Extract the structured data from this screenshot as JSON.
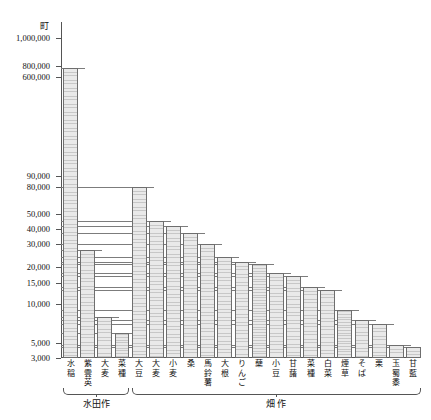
{
  "chart_data": {
    "type": "bar",
    "title": "",
    "subtitle": "",
    "unit_label": "町",
    "xlabel": "",
    "ylabel": "",
    "scale": "log",
    "ylim": [
      3000,
      1000000
    ],
    "grid": true,
    "legend_position": "none",
    "ytick_labels": [
      "1,000,000",
      "800,000",
      "600,000",
      "90,000",
      "80,000",
      "50,000",
      "40,000",
      "30,000",
      "20,000",
      "15,000",
      "10,000",
      "5,000",
      "3,000"
    ],
    "ytick_values": [
      1000000,
      800000,
      600000,
      90000,
      80000,
      50000,
      40000,
      30000,
      20000,
      15000,
      10000,
      5000,
      3000
    ],
    "categories": [
      "水稲",
      "紫雲英",
      "大麦",
      "菜種",
      "大豆",
      "大麦",
      "小麦",
      "桑",
      "馬鈴薯",
      "大根",
      "りんご",
      "蘖",
      "小豆",
      "甘藷",
      "菜種",
      "白菜",
      "煙草",
      "そば",
      "栗",
      "玉蜀黍",
      "甘藍"
    ],
    "values": [
      760000,
      27000,
      8000,
      6000,
      80000,
      45000,
      42000,
      37000,
      30000,
      24000,
      22000,
      21000,
      18000,
      17000,
      14000,
      13000,
      9000,
      7500,
      7000,
      4600,
      4400
    ],
    "groups": [
      {
        "label": "水田作",
        "start_index": 0,
        "end_index": 3
      },
      {
        "label": "畑 作",
        "start_index": 4,
        "end_index": 20
      }
    ]
  }
}
